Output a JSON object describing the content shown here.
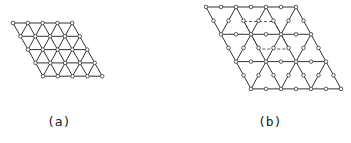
{
  "figure": {
    "panels": [
      {
        "id": "a",
        "label": "(a)",
        "lattice": "triangular",
        "rows": 5,
        "cols": 5,
        "origin": [
          13,
          23
        ],
        "dx": 14.8,
        "row_shift": 7.5,
        "dy": 13.3
      },
      {
        "id": "b",
        "label": "(b)",
        "lattice": "kagome",
        "big_rows": 4,
        "big_cols": 4,
        "origin": [
          206,
          7
        ],
        "a": 30,
        "row_shift": 15,
        "dy": 27.3,
        "unit_cell": "dashed-rhombus"
      }
    ],
    "colors": {
      "line": "#333333",
      "node_fill": "#ffffff",
      "background": "#ffffff"
    }
  }
}
